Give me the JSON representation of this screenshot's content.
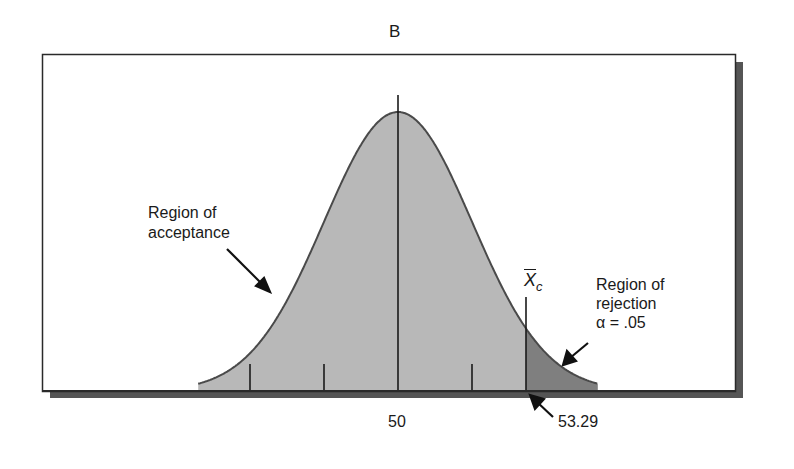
{
  "chart_data": {
    "type": "area",
    "title": "B",
    "distribution": "normal",
    "mean": 50,
    "critical_value": 53.29,
    "alpha": 0.05,
    "x_tick_labels": [
      "50",
      "53.29"
    ],
    "tick_marks_sd": [
      -2,
      -1,
      0,
      1
    ],
    "regions": [
      {
        "name": "Region of acceptance",
        "range": [
          "-inf",
          53.29
        ],
        "color": "#b8b8b8"
      },
      {
        "name": "Region of rejection",
        "range": [
          53.29,
          "inf"
        ],
        "color": "#7f7f7f",
        "alpha": 0.05
      }
    ],
    "annotations": [
      {
        "text_lines": [
          "Region of",
          "acceptance"
        ],
        "arrow_to": "acceptance area"
      },
      {
        "text_lines": [
          "Region of",
          "rejection",
          "α = .05"
        ],
        "arrow_to": "rejection tail"
      },
      {
        "text": "X̄c",
        "at": "critical line"
      },
      {
        "text": "53.29",
        "arrow_to": "critical value on axis"
      }
    ],
    "grid": false,
    "legend": "none"
  },
  "labels": {
    "title": "B",
    "acceptance_line1": "Region of",
    "acceptance_line2": "acceptance",
    "rejection_line1": "Region of",
    "rejection_line2": "rejection",
    "rejection_line3": "α = .05",
    "critical_symbol": "X",
    "critical_subscript": "c",
    "mean_label": "50",
    "critical_label": "53.29"
  },
  "colors": {
    "acceptance_fill": "#b8b8b8",
    "rejection_fill": "#7f7f7f",
    "curve_stroke": "#4a4a4a",
    "frame": "#2a2a2a",
    "shadow": "#555555"
  }
}
